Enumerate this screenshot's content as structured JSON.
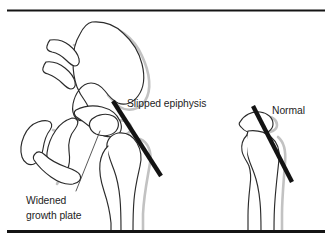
{
  "figure": {
    "kind": "medical-illustration",
    "background_color": "#ffffff",
    "outline_color": "#2b2b2b",
    "shadow_color": "#c2c2c2",
    "marker_color": "#131313",
    "text_color": "#1d1d1d",
    "width": 331,
    "height": 241
  },
  "rules": {
    "top": {
      "thickness": 2,
      "color": "#141414"
    },
    "bottom": {
      "thickness": 3,
      "color": "#141414"
    }
  },
  "labels": {
    "slipped_epiphysis": "Slipped epiphysis",
    "widened_growth_plate_line1": "Widened",
    "widened_growth_plate_line2": "growth plate",
    "normal": "Normal"
  },
  "panels": [
    {
      "id": "affected-hip",
      "name": "Affected hip with slipped epiphysis",
      "label": "Slipped epiphysis",
      "klein_line": {
        "x1": 113,
        "y1": 101,
        "x2": 161,
        "y2": 176
      }
    },
    {
      "id": "normal-hip",
      "name": "Normal proximal femur",
      "label": "Normal",
      "klein_line": {
        "x1": 253,
        "y1": 106,
        "x2": 292,
        "y2": 182
      }
    }
  ],
  "annotations": [
    {
      "id": "slipped-epiphysis-annotation",
      "text": "Slipped epiphysis",
      "points_to": "femoral epiphysis displaced off the neck"
    },
    {
      "id": "widened-growth-plate-annotation",
      "text": "Widened growth plate",
      "points_to": "physis between epiphysis and femoral neck"
    },
    {
      "id": "normal-annotation",
      "text": "Normal",
      "points_to": "unaffected proximal femur for comparison"
    }
  ]
}
